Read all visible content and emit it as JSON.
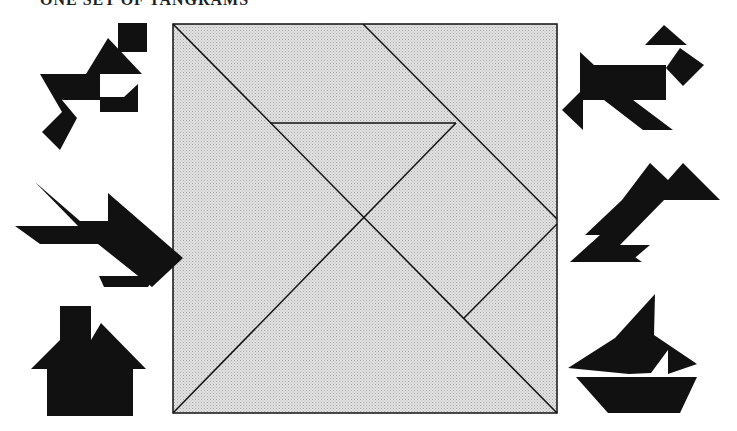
{
  "header": {
    "text": "ONE SET OF TANGRAMS"
  },
  "colors": {
    "silhouette": "#111111",
    "tile_fill": "#d9d9d9",
    "tile_stroke": "#111111",
    "background": "#ffffff"
  },
  "tangram_square": {
    "label": "Tangram square divided into seven pieces",
    "pieces": [
      "large-triangle-left",
      "large-triangle-bottom",
      "medium-triangle",
      "small-triangle-top",
      "small-triangle-right",
      "square",
      "parallelogram"
    ]
  },
  "silhouettes": {
    "left": [
      "running-man",
      "fish",
      "house"
    ],
    "right": [
      "dog",
      "bird",
      "sailboat"
    ]
  }
}
